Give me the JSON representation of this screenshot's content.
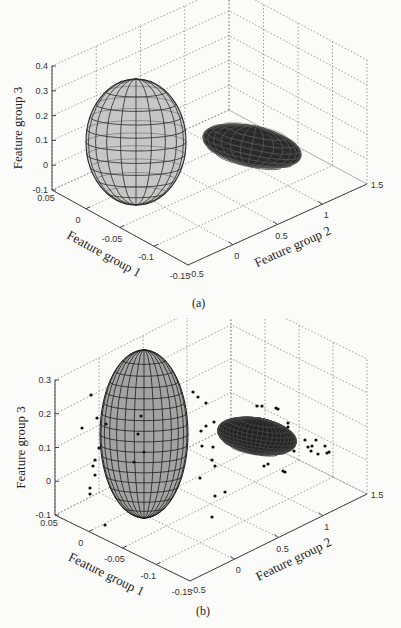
{
  "chart_data": [
    {
      "type": "3d-surface",
      "panel": "(a)",
      "caption": "(a)",
      "style": "wireframe ellipsoids",
      "xlabel": "Feature group 1",
      "ylabel": "Feature group 2",
      "zlabel": "Feature group 3",
      "x_ticks": [
        "0.05",
        "0",
        "-0.05",
        "-0.1",
        "-0.15"
      ],
      "y_ticks": [
        "-0.5",
        "0",
        "0.5",
        "1",
        "1.5"
      ],
      "z_ticks": [
        "-0.1",
        "0",
        "0.1",
        "0.2",
        "0.3",
        "0.4"
      ],
      "xlim": [
        -0.15,
        0.05
      ],
      "ylim": [
        -0.5,
        1.5
      ],
      "zlim": [
        -0.1,
        0.4
      ],
      "grid": true,
      "objects": [
        {
          "name": "Class 1 ellipsoid",
          "shape": "tall ellipsoid",
          "fill": "#b8b8b8",
          "center_approx": {
            "x": -0.02,
            "y": 0.0,
            "z": 0.12
          }
        },
        {
          "name": "Class 2 ellipsoid",
          "shape": "flat ellipsoid",
          "fill": "#2a2a2a",
          "center_approx": {
            "x": -0.05,
            "y": 1.0,
            "z": 0.1
          }
        }
      ]
    },
    {
      "type": "3d-surface+scatter",
      "panel": "(b)",
      "caption": "(b)",
      "style": "solid ellipsoids with sample points",
      "xlabel": "Feature group 1",
      "ylabel": "Feature group 2",
      "zlabel": "Feature group 3",
      "x_ticks": [
        "0.05",
        "0",
        "-0.05",
        "-0.1",
        "-0.15"
      ],
      "y_ticks": [
        "-0.5",
        "0",
        "0.5",
        "1",
        "1.5"
      ],
      "z_ticks": [
        "-0.1",
        "0",
        "0.1",
        "0.2",
        "0.3"
      ],
      "xlim": [
        -0.15,
        0.05
      ],
      "ylim": [
        -0.5,
        1.5
      ],
      "zlim": [
        -0.1,
        0.3
      ],
      "grid": true,
      "objects": [
        {
          "name": "Class 1 ellipsoid",
          "shape": "tall ellipsoid",
          "fill": "#a0a0a0"
        },
        {
          "name": "Class 2 ellipsoid",
          "shape": "flat ellipsoid",
          "fill": "#222222"
        }
      ],
      "scatter_points_screen": [
        [
          91,
          395
        ],
        [
          82,
          428
        ],
        [
          97,
          418
        ],
        [
          99,
          448
        ],
        [
          95,
          460
        ],
        [
          93,
          466
        ],
        [
          95,
          475
        ],
        [
          90,
          488
        ],
        [
          90,
          494
        ],
        [
          106,
          424
        ],
        [
          141,
          416
        ],
        [
          138,
          434
        ],
        [
          144,
          452
        ],
        [
          134,
          462
        ],
        [
          105,
          525
        ],
        [
          198,
          397
        ],
        [
          206,
          403
        ],
        [
          214,
          422
        ],
        [
          206,
          426
        ],
        [
          201,
          431
        ],
        [
          202,
          446
        ],
        [
          213,
          447
        ],
        [
          212,
          460
        ],
        [
          200,
          478
        ],
        [
          215,
          496
        ],
        [
          212,
          517
        ],
        [
          215,
          466
        ],
        [
          193,
          392
        ],
        [
          225,
          492
        ],
        [
          257,
          406
        ],
        [
          262,
          406
        ],
        [
          276,
          408
        ],
        [
          278,
          409
        ],
        [
          288,
          423
        ],
        [
          288,
          427
        ],
        [
          264,
          466
        ],
        [
          268,
          464
        ],
        [
          283,
          471
        ],
        [
          285,
          472
        ],
        [
          294,
          451
        ],
        [
          305,
          440
        ],
        [
          308,
          447
        ],
        [
          312,
          446
        ],
        [
          316,
          440
        ],
        [
          318,
          454
        ],
        [
          311,
          451
        ],
        [
          325,
          446
        ],
        [
          329,
          452
        ],
        [
          327,
          453
        ]
      ]
    }
  ]
}
